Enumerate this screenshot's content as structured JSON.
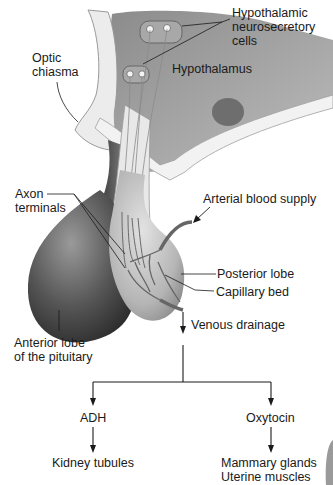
{
  "labels": {
    "hypothalamic_cells_1": "Hypothalamic",
    "hypothalamic_cells_2": "neurosecretory",
    "hypothalamic_cells_3": "cells",
    "optic_chiasma_1": "Optic",
    "optic_chiasma_2": "chiasma",
    "hypothalamus": "Hypothalamus",
    "axon_terminals_1": "Axon",
    "axon_terminals_2": "terminals",
    "arterial_blood_supply": "Arterial blood supply",
    "posterior_lobe": "Posterior lobe",
    "capillary_bed": "Capillary bed",
    "venous_drainage": "Venous drainage",
    "anterior_lobe_1": "Anterior lobe",
    "anterior_lobe_2": "of the pituitary"
  },
  "flowchart": {
    "hormones": [
      {
        "name": "ADH",
        "targets": [
          "Kidney tubules"
        ]
      },
      {
        "name": "Oxytocin",
        "targets": [
          "Mammary glands",
          "Uterine muscles"
        ]
      }
    ]
  },
  "colors": {
    "line": "#1a1a1a",
    "tissue_dark": "#4a4a4a",
    "tissue_mid": "#8a8a8a",
    "tissue_light": "#c8c8c8",
    "background": "#ffffff"
  }
}
